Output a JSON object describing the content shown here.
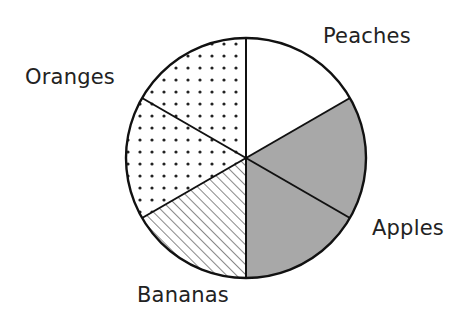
{
  "chart_data": {
    "type": "pie",
    "title": "",
    "categories": [
      "Peaches",
      "Apples",
      "Bananas",
      "Oranges"
    ],
    "values": [
      1,
      2,
      1,
      2
    ],
    "units": "slices (each 1/6 of the circle)",
    "fractions": [
      0.1667,
      0.3333,
      0.1667,
      0.3333
    ],
    "slices": [
      {
        "label": "Peaches",
        "count": 1,
        "fill": "white"
      },
      {
        "label": "Apples",
        "count": 2,
        "fill": "solid-gray"
      },
      {
        "label": "Bananas",
        "count": 1,
        "fill": "diagonal-hatch"
      },
      {
        "label": "Oranges",
        "count": 2,
        "fill": "dotted"
      }
    ],
    "start_angle_deg": 0,
    "direction": "clockwise from 12 o'clock",
    "legend": "labels placed next to slices",
    "colors": {
      "outline": "#111111",
      "gray": "#a8a8a8",
      "white": "#ffffff",
      "pattern": "#222222"
    }
  },
  "labels": {
    "peaches": "Peaches",
    "apples": "Apples",
    "bananas": "Bananas",
    "oranges": "Oranges"
  }
}
